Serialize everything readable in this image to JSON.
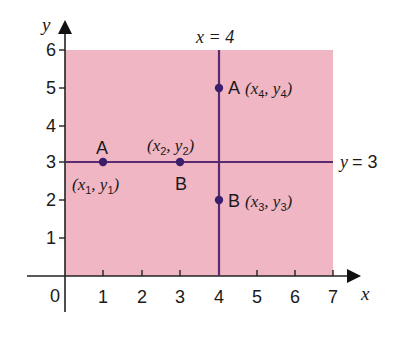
{
  "diagram": {
    "type": "coordinate-grid",
    "colors": {
      "region_fill": "#f0b6c4",
      "line": "#5a2a6e",
      "point": "#3a1f6b",
      "axis": "#222222",
      "text": "#1a1a1a"
    },
    "axes": {
      "x_label": "x",
      "y_label": "y",
      "x_ticks": [
        "1",
        "2",
        "3",
        "4",
        "5",
        "6",
        "7"
      ],
      "y_ticks": [
        "1",
        "2",
        "3",
        "4",
        "5",
        "6"
      ],
      "origin_label": "0"
    },
    "lines": [
      {
        "label": "x = 4",
        "orientation": "vertical",
        "value": 4
      },
      {
        "label": "y = 3",
        "orientation": "horizontal",
        "value": 3
      }
    ],
    "points": [
      {
        "name": "A",
        "coord_label": "(x1, y1)",
        "x": 1,
        "y": 3
      },
      {
        "name": "B",
        "coord_label": "(x2, y2)",
        "x": 3,
        "y": 3
      },
      {
        "name": "A",
        "coord_label": "(x4, y4)",
        "x": 4,
        "y": 5
      },
      {
        "name": "B",
        "coord_label": "(x3, y3)",
        "x": 4,
        "y": 2
      }
    ],
    "labels": {
      "line_x4": "x = 4",
      "line_y3_prefix": "y",
      "line_y3_suffix": "= 3",
      "p1_name": "A",
      "p1_x": "x",
      "p1_xs": "1",
      "p1_y": "y",
      "p1_ys": "1",
      "p2_name": "B",
      "p2_x": "x",
      "p2_xs": "2",
      "p2_y": "y",
      "p2_ys": "2",
      "p3_name": "B",
      "p3_x": "x",
      "p3_xs": "3",
      "p3_y": "y",
      "p3_ys": "3",
      "p4_name": "A",
      "p4_x": "x",
      "p4_xs": "4",
      "p4_y": "y",
      "p4_ys": "4"
    }
  }
}
